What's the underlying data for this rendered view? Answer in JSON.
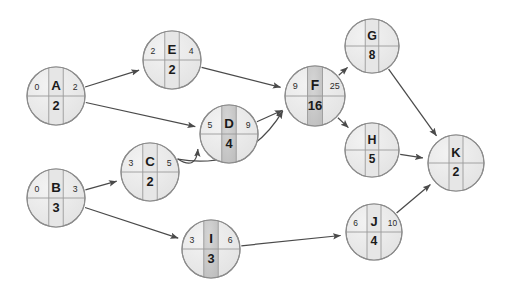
{
  "diagram": {
    "type": "activity-network-diagram",
    "canvas": {
      "width": 513,
      "height": 293,
      "background": "#ffffff"
    },
    "style": {
      "node_fill": "#ececec",
      "node_fill_highlight": "#c9c9c9",
      "node_stroke": "#8c8c8c",
      "divider_stroke": "#9a9a9a",
      "edge_stroke": "#4a4a4a",
      "text_color": "#1a1a1a"
    },
    "legend": {
      "cell_meaning_left": "earliest start",
      "cell_meaning_right": "earliest finish",
      "cell_meaning_center": "activity name",
      "cell_meaning_bottom": "duration"
    },
    "nodes": [
      {
        "id": "A",
        "name": "A",
        "left": "0",
        "right": "2",
        "bottom": "2",
        "cx": 56,
        "cy": 96,
        "r": 29,
        "highlight": false
      },
      {
        "id": "E",
        "name": "E",
        "left": "2",
        "right": "4",
        "bottom": "2",
        "cx": 172,
        "cy": 60,
        "r": 29,
        "highlight": false
      },
      {
        "id": "D",
        "name": "D",
        "left": "5",
        "right": "9",
        "bottom": "4",
        "cx": 229,
        "cy": 134,
        "r": 29,
        "highlight": true
      },
      {
        "id": "C",
        "name": "C",
        "left": "3",
        "right": "5",
        "bottom": "2",
        "cx": 150,
        "cy": 172,
        "r": 29,
        "highlight": false
      },
      {
        "id": "B",
        "name": "B",
        "left": "0",
        "right": "3",
        "bottom": "3",
        "cx": 56,
        "cy": 198,
        "r": 29,
        "highlight": false
      },
      {
        "id": "I",
        "name": "I",
        "left": "3",
        "right": "6",
        "bottom": "3",
        "cx": 211,
        "cy": 249,
        "r": 29,
        "highlight": true
      },
      {
        "id": "F",
        "name": "F",
        "left": "9",
        "right": "25",
        "bottom": "16",
        "cx": 315,
        "cy": 96,
        "r": 30,
        "highlight": true
      },
      {
        "id": "G",
        "name": "G",
        "left": "",
        "right": "",
        "bottom": "8",
        "cx": 372,
        "cy": 46,
        "r": 27,
        "highlight": false
      },
      {
        "id": "H",
        "name": "H",
        "left": "",
        "right": "",
        "bottom": "5",
        "cx": 372,
        "cy": 150,
        "r": 27,
        "highlight": false
      },
      {
        "id": "J",
        "name": "J",
        "left": "6",
        "right": "10",
        "bottom": "4",
        "cx": 374,
        "cy": 232,
        "r": 28,
        "highlight": false
      },
      {
        "id": "K",
        "name": "K",
        "left": "",
        "right": "",
        "bottom": "2",
        "cx": 456,
        "cy": 163,
        "r": 28,
        "highlight": false
      }
    ],
    "edges": [
      {
        "from": "A",
        "to": "E",
        "curved": false
      },
      {
        "from": "A",
        "to": "D",
        "curved": false
      },
      {
        "from": "E",
        "to": "F",
        "curved": false
      },
      {
        "from": "B",
        "to": "C",
        "curved": false
      },
      {
        "from": "B",
        "to": "I",
        "curved": false
      },
      {
        "from": "C",
        "to": "D",
        "curved": true
      },
      {
        "from": "C",
        "to": "F",
        "curved": true
      },
      {
        "from": "D",
        "to": "F",
        "curved": false
      },
      {
        "from": "F",
        "to": "G",
        "curved": false
      },
      {
        "from": "F",
        "to": "H",
        "curved": false
      },
      {
        "from": "I",
        "to": "J",
        "curved": false
      },
      {
        "from": "G",
        "to": "K",
        "curved": false
      },
      {
        "from": "H",
        "to": "K",
        "curved": false
      },
      {
        "from": "J",
        "to": "K",
        "curved": false
      }
    ]
  }
}
